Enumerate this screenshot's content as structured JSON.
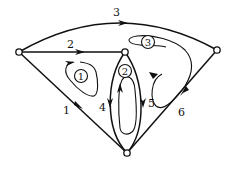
{
  "diagram": {
    "type": "directed graph with loops",
    "nodes": [
      {
        "id": "A",
        "position": "left",
        "x": 19,
        "y": 52
      },
      {
        "id": "B",
        "position": "top-center",
        "x": 125,
        "y": 52
      },
      {
        "id": "C",
        "position": "right",
        "x": 217,
        "y": 50
      },
      {
        "id": "D",
        "position": "bottom",
        "x": 127,
        "y": 153
      }
    ],
    "edges": [
      {
        "label": "1",
        "from": "A",
        "to": "D",
        "shape": "straight"
      },
      {
        "label": "2",
        "from": "A",
        "to": "B",
        "shape": "straight"
      },
      {
        "label": "3",
        "from": "A",
        "to": "C",
        "shape": "arc"
      },
      {
        "label": "4",
        "from": "B",
        "to": "D",
        "shape": "curved-left"
      },
      {
        "label": "5",
        "from": "B",
        "to": "D",
        "shape": "curved-right"
      },
      {
        "label": "6",
        "from": "C",
        "to": "D",
        "shape": "straight"
      }
    ],
    "loops": [
      {
        "label": "1",
        "region": "between edges 1 and 2"
      },
      {
        "label": "2",
        "region": "between edges 4 and 5"
      },
      {
        "label": "3",
        "region": "between edges 3, 5 and 6"
      }
    ]
  }
}
